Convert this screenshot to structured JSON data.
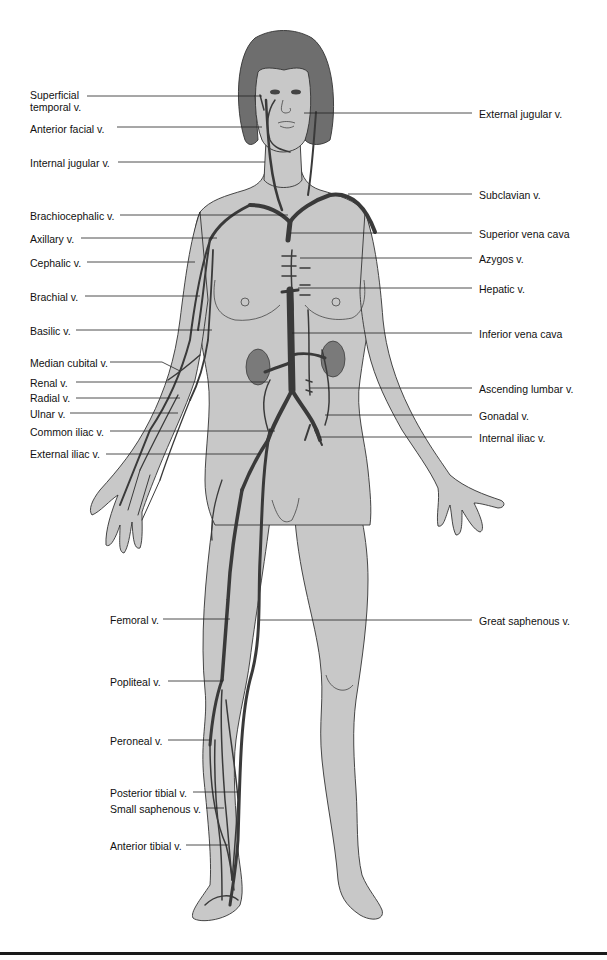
{
  "diagram": {
    "colors": {
      "skin": "#c8c8c8",
      "hair": "#6e6e6e",
      "vein": "#3a3a3a",
      "outline": "#333333",
      "leader": "#222222",
      "kidney": "#7a7a7a"
    },
    "labels_left": [
      {
        "id": "superficial-temporal",
        "text": "Superficial temporal v.",
        "line1": "Superficial",
        "line2": "temporal v."
      },
      {
        "id": "anterior-facial",
        "text": "Anterior facial v."
      },
      {
        "id": "internal-jugular",
        "text": "Internal jugular v."
      },
      {
        "id": "brachiocephalic",
        "text": "Brachiocephalic v."
      },
      {
        "id": "axillary",
        "text": "Axillary v."
      },
      {
        "id": "cephalic",
        "text": "Cephalic v."
      },
      {
        "id": "brachial",
        "text": "Brachial v."
      },
      {
        "id": "basilic",
        "text": "Basilic v."
      },
      {
        "id": "median-cubital",
        "text": "Median cubital v."
      },
      {
        "id": "renal",
        "text": "Renal v."
      },
      {
        "id": "radial",
        "text": "Radial v."
      },
      {
        "id": "ulnar",
        "text": "Ulnar v."
      },
      {
        "id": "common-iliac",
        "text": "Common iliac v."
      },
      {
        "id": "external-iliac",
        "text": "External iliac v."
      },
      {
        "id": "femoral",
        "text": "Femoral v."
      },
      {
        "id": "popliteal",
        "text": "Popliteal v."
      },
      {
        "id": "peroneal",
        "text": "Peroneal v."
      },
      {
        "id": "posterior-tibial",
        "text": "Posterior tibial v."
      },
      {
        "id": "small-saphenous",
        "text": "Small saphenous v."
      },
      {
        "id": "anterior-tibial",
        "text": "Anterior tibial v."
      }
    ],
    "labels_right": [
      {
        "id": "external-jugular",
        "text": "External jugular v."
      },
      {
        "id": "subclavian",
        "text": "Subclavian v."
      },
      {
        "id": "superior-vena-cava",
        "text": "Superior vena cava"
      },
      {
        "id": "azygos",
        "text": "Azygos v."
      },
      {
        "id": "hepatic",
        "text": "Hepatic v."
      },
      {
        "id": "inferior-vena-cava",
        "text": "Inferior vena cava"
      },
      {
        "id": "ascending-lumbar",
        "text": "Ascending lumbar v."
      },
      {
        "id": "gonadal",
        "text": "Gonadal v."
      },
      {
        "id": "internal-iliac",
        "text": "Internal iliac v."
      },
      {
        "id": "great-saphenous",
        "text": "Great saphenous v."
      }
    ]
  }
}
